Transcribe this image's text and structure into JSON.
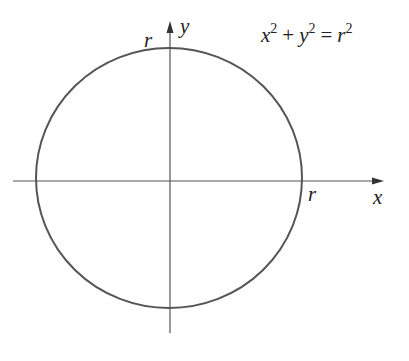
{
  "diagram": {
    "type": "circle-on-axes",
    "equation": {
      "term1_var": "x",
      "term1_exp": "2",
      "plus": "+",
      "term2_var": "y",
      "term2_exp": "2",
      "equals": "=",
      "rhs_var": "r",
      "rhs_exp": "2"
    },
    "axes": {
      "x_label": "x",
      "y_label": "y"
    },
    "radius_labels": {
      "top": "r",
      "right": "r"
    },
    "colors": {
      "stroke": "#444444",
      "text": "#222222",
      "background": "#ffffff"
    }
  }
}
